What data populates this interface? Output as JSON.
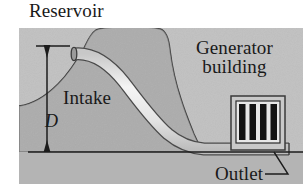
{
  "figure": {
    "labels": {
      "reservoir": "Reservoir",
      "generator_line1": "Generator",
      "generator_line2": "building",
      "intake": "Intake",
      "outlet": "Outlet",
      "depth_symbol": "D"
    },
    "colors": {
      "panel_background": "#b8b8b8",
      "hill_fill": "#a8a8a8",
      "hill_outline": "#3c3c3c",
      "pipe_fill": "#ededed",
      "pipe_outline": "#4a4a4a",
      "window_bar": "#141414",
      "building_outline": "#3c3c3c",
      "ground_line": "#1e1e1e",
      "text": "#191919",
      "page_background": "#ffffff"
    },
    "geometry": {
      "panel": {
        "x": 19,
        "y": 28,
        "width": 284,
        "height": 156
      },
      "ground_line_y": 152,
      "dimension_line_x": 47,
      "dimension_top_y": 46,
      "dimension_bottom_y": 151,
      "building": {
        "x": 231,
        "y": 96,
        "width": 54,
        "height": 54
      },
      "window_bar_count": 4
    }
  }
}
